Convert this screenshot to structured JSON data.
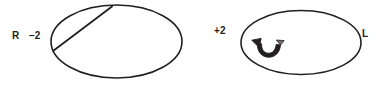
{
  "figure": {
    "title": "",
    "background_color": "#ffffff",
    "stroke_color": "#231f20",
    "width": 379,
    "height": 88,
    "labels": {
      "left_side": "R",
      "left_value": "–2",
      "right_value": "+2",
      "right_side": "L"
    },
    "shapes": [
      {
        "name": "left-ellipse",
        "type": "ellipse",
        "cx": 116.5,
        "cy": 41.5,
        "rx": 65.5,
        "ry": 36.5
      },
      {
        "name": "chord-line",
        "type": "line",
        "x1": 112,
        "y1": 6,
        "x2": 53,
        "y2": 51
      },
      {
        "name": "right-ellipse",
        "type": "ellipse",
        "cx": 301,
        "cy": 42.5,
        "rx": 60,
        "ry": 32
      },
      {
        "name": "curved-arrow",
        "type": "arrow",
        "description": "curved scoop arrow pointing up-left"
      }
    ]
  }
}
